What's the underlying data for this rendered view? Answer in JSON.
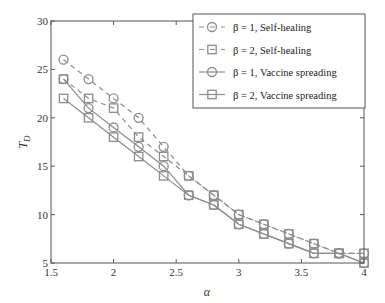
{
  "chart_data": {
    "type": "line",
    "title": "",
    "xlabel": "α",
    "ylabel": "T_D",
    "xlim": [
      1.5,
      4
    ],
    "ylim": [
      5,
      30
    ],
    "xticks": [
      1.5,
      2,
      2.5,
      3,
      3.5,
      4
    ],
    "xtick_labels": [
      "1.5",
      "2",
      "2.5",
      "3",
      "3.5",
      "4"
    ],
    "yticks": [
      5,
      10,
      15,
      20,
      25,
      30
    ],
    "ytick_labels": [
      "5",
      "10",
      "15",
      "20",
      "25",
      "30"
    ],
    "grid": false,
    "legend_position": "upper right",
    "x": [
      1.6,
      1.8,
      2.0,
      2.2,
      2.4,
      2.6,
      2.8,
      3.0,
      3.2,
      3.4,
      3.6,
      3.8,
      4.0
    ],
    "series": [
      {
        "name": "β = 1, Self-healing",
        "linestyle": "dashed",
        "marker": "circle",
        "values": [
          26,
          24,
          22,
          20,
          17,
          14,
          12,
          10,
          9,
          8,
          7,
          6,
          6
        ]
      },
      {
        "name": "β = 2, Self-healing",
        "linestyle": "dashed",
        "marker": "square",
        "values": [
          24,
          22,
          21,
          18,
          16,
          14,
          12,
          10,
          9,
          8,
          7,
          6,
          6
        ]
      },
      {
        "name": "β = 1, Vaccine spreading",
        "linestyle": "solid",
        "marker": "circle",
        "values": [
          24,
          21,
          19,
          17,
          15,
          12,
          11,
          9,
          8,
          7,
          6,
          6,
          5
        ]
      },
      {
        "name": "β = 2, Vaccine spreading",
        "linestyle": "solid",
        "marker": "square",
        "values": [
          22,
          20,
          18,
          16,
          14,
          12,
          11,
          9,
          8,
          7,
          6,
          6,
          5
        ]
      }
    ]
  },
  "colors": {
    "line": "#8c8c8c",
    "axis": "#555555",
    "text": "#333333"
  },
  "legend": {
    "items": [
      {
        "label": "β = 1, Self-healing"
      },
      {
        "label": "β = 2, Self-healing"
      },
      {
        "label": "β = 1, Vaccine spreading"
      },
      {
        "label": "β = 2, Vaccine spreading"
      }
    ]
  },
  "axes": {
    "xlabel": "α",
    "ylabel_main": "T",
    "ylabel_sub": "D"
  }
}
